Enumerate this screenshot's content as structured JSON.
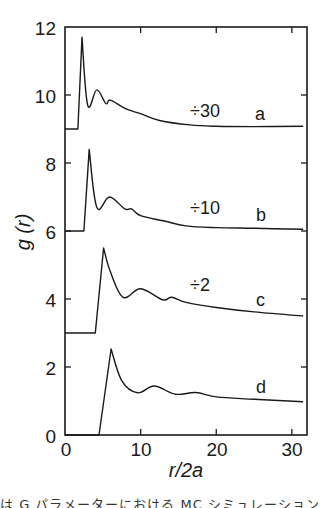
{
  "chart_data": {
    "type": "line",
    "title": "",
    "xlabel": "r/2a",
    "ylabel": "g (r)",
    "xlim": [
      0,
      32
    ],
    "ylim": [
      0,
      12
    ],
    "x_ticks": [
      0,
      10,
      20,
      30
    ],
    "y_ticks": [
      0,
      2,
      4,
      6,
      8,
      10,
      12
    ],
    "grid": false,
    "legend": "none (curves labelled inline a, b, c, d)",
    "note": "Curves are vertically offset: a by +9, b by +6, c by +3, d by 0; peak heights scaled by the indicated divisors",
    "series": [
      {
        "name": "a",
        "offset": 9,
        "scale_label": "÷30",
        "x": [
          0,
          1.7,
          2.25,
          3.0,
          4.2,
          5.4,
          6.0,
          8.0,
          10.0,
          12.5,
          16.5,
          20,
          25,
          31.5
        ],
        "y": [
          9.0,
          9.0,
          11.7,
          9.7,
          10.15,
          9.75,
          9.85,
          9.6,
          9.45,
          9.25,
          9.12,
          9.08,
          9.07,
          9.08
        ]
      },
      {
        "name": "b",
        "offset": 6,
        "scale_label": "÷10",
        "x": [
          0,
          2.5,
          3.2,
          4.2,
          5.9,
          7.9,
          8.8,
          10,
          13,
          16,
          20,
          25,
          31.5
        ],
        "y": [
          6.0,
          6.0,
          8.4,
          6.7,
          7.0,
          6.65,
          6.65,
          6.45,
          6.3,
          6.15,
          6.1,
          6.08,
          6.05
        ]
      },
      {
        "name": "c",
        "offset": 3,
        "scale_label": "÷2",
        "x": [
          0,
          4.0,
          5.1,
          6.0,
          7.7,
          10.0,
          12.9,
          14.1,
          16,
          20,
          25,
          31.5
        ],
        "y": [
          3.0,
          3.0,
          5.5,
          4.8,
          4.05,
          4.3,
          3.98,
          4.05,
          3.9,
          3.75,
          3.62,
          3.5
        ]
      },
      {
        "name": "d",
        "offset": 0,
        "scale_label": "",
        "x": [
          0,
          4.5,
          6.1,
          7.5,
          9.6,
          11.8,
          14.6,
          17.3,
          20,
          25,
          31.5
        ],
        "y": [
          0.0,
          0.0,
          2.53,
          1.6,
          1.24,
          1.44,
          1.2,
          1.25,
          1.12,
          1.05,
          0.98
        ]
      }
    ]
  },
  "annotations": {
    "a_scale": "÷30",
    "a_label": "a",
    "b_scale": "÷10",
    "b_label": "b",
    "c_scale": "÷2",
    "c_label": "c",
    "d_label": "d"
  },
  "axes": {
    "x_title": "r/2a",
    "y_title": "g (r)",
    "x_tick_labels": [
      "0",
      "10",
      "20",
      "30"
    ],
    "y_tick_labels": [
      "0",
      "2",
      "4",
      "6",
      "8",
      "10",
      "12"
    ]
  },
  "caption_fragment": "は G パラメーターにおける MC シミュレーション"
}
